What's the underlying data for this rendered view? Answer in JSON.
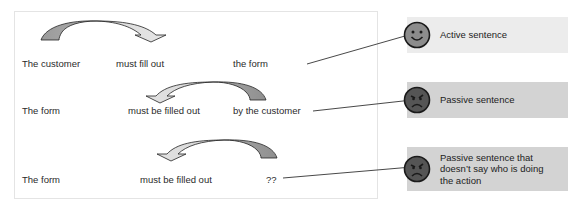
{
  "rows": [
    {
      "subject": "The customer",
      "verb": "must fill out",
      "object": "the form",
      "arrow_direction": "right"
    },
    {
      "subject": "The form",
      "verb": "must be filled out",
      "object": "by the customer",
      "arrow_direction": "left"
    },
    {
      "subject": "The form",
      "verb": "must be filled out",
      "object": "??",
      "arrow_direction": "left"
    }
  ],
  "callouts": [
    {
      "label": "Active sentence",
      "face": "smiley-icon",
      "bg": "#ececec"
    },
    {
      "label": "Passive sentence",
      "face": "frown-icon",
      "bg": "#d3d3d3"
    },
    {
      "label": "Passive sentence that doesn’t say who is doing the action",
      "face": "frown-icon",
      "bg": "#d3d3d3"
    }
  ],
  "colors": {
    "arrow_dark": "#9a9a9a",
    "arrow_light": "#dcdcdc",
    "smiley": "#8c8c8c",
    "frown": "#555555"
  }
}
